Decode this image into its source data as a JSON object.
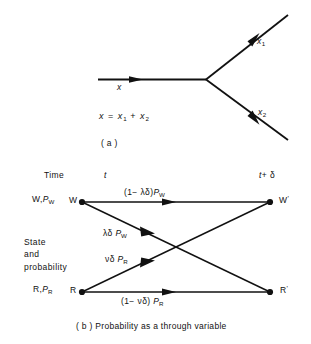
{
  "figure": {
    "panel_a": {
      "tag": "( a )",
      "equation_x": "x",
      "equation_eq": "=",
      "equation_x1": "x",
      "equation_sub1": "1",
      "equation_plus": "+",
      "equation_x2": "x",
      "equation_sub2": "2",
      "branch_in_label": "x",
      "branch_up_label": "x",
      "branch_up_sub": "1",
      "branch_down_label": "x",
      "branch_down_sub": "2"
    },
    "panel_b": {
      "tag": "( b )",
      "caption": "Probability as a through variable",
      "time_label": "Time",
      "time_left": "t",
      "time_right_t": "t",
      "time_right_rest": "+ δ",
      "axis_label_lines": [
        "State",
        "and",
        "probability"
      ],
      "row_w": {
        "left_state": "W,",
        "left_prob_p": "P",
        "left_prob_sub": "W",
        "node_start": "W",
        "node_end": "W",
        "node_end_prime": "'"
      },
      "row_r": {
        "left_state": "R,",
        "left_prob_p": "P",
        "left_prob_sub": "R",
        "node_start": "R",
        "node_end": "R",
        "node_end_prime": "'"
      },
      "edges": [
        {
          "name": "w-to-w",
          "prefix": "(1− λδ)",
          "p": "P",
          "sub": "W"
        },
        {
          "name": "w-to-r",
          "prefix": "λδ ",
          "p": "P",
          "sub": "W"
        },
        {
          "name": "r-to-w",
          "prefix": "νδ ",
          "p": "P",
          "sub": "R"
        },
        {
          "name": "r-to-r",
          "prefix": "(1− νδ) ",
          "p": "P",
          "sub": "R"
        }
      ]
    },
    "colors": {
      "ink": "#111111",
      "background": "#ffffff"
    }
  }
}
